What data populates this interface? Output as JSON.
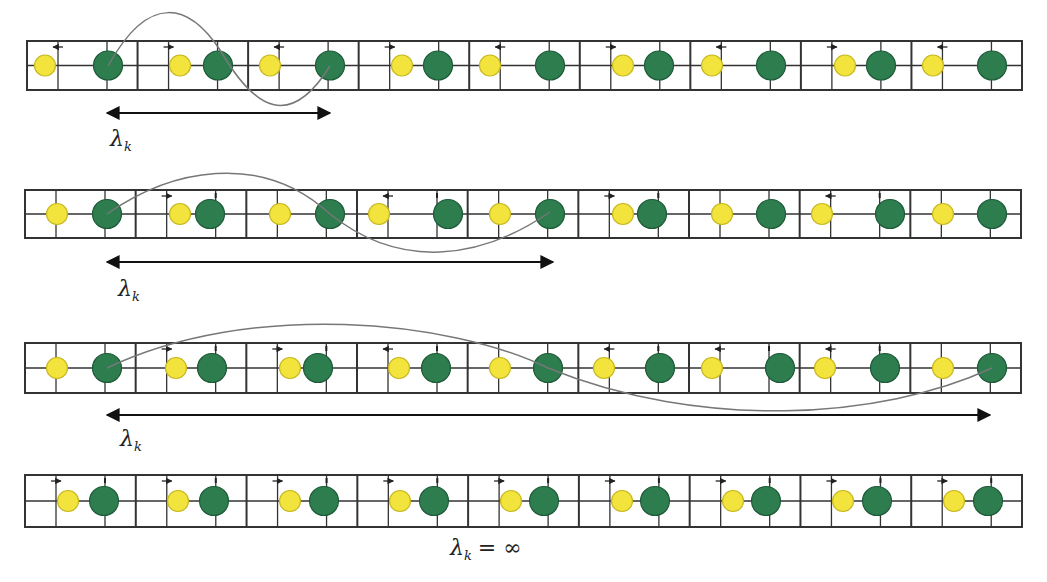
{
  "figure": {
    "title": "",
    "colors": {
      "grid_line": "#333333",
      "yellow_atom": "#f2e43c",
      "yellow_atom_stroke": "#c8b820",
      "green_atom": "#2e7d4f",
      "green_atom_stroke": "#1d5a37",
      "wave": "#777777",
      "arrow": "#111111"
    },
    "cell_count": 9,
    "rows": [
      {
        "id": "row-1",
        "box": {
          "x": 27,
          "y": 41,
          "w": 995,
          "h": 49
        },
        "yellow_x": [
          45,
          180,
          270,
          402,
          490,
          623,
          712,
          845,
          933
        ],
        "green_x": [
          108,
          218,
          330,
          438,
          550,
          659,
          771,
          881,
          992
        ],
        "displacement_arrows": [
          "left",
          "right",
          "left",
          "right",
          "left",
          "right",
          "left",
          "right",
          "left"
        ],
        "wave_path": "M108,66 C150,-10 190,5 220,50 C255,110 290,130 330,66",
        "wavelength_arrow": {
          "x1": 107,
          "x2": 330,
          "y": 113
        },
        "label": {
          "symbol": "λ",
          "subscript": "k",
          "x": 110,
          "y": 126
        }
      },
      {
        "id": "row-2",
        "box": {
          "x": 25,
          "y": 190,
          "w": 996,
          "h": 48
        },
        "yellow_x": [
          57,
          180,
          280,
          379,
          500,
          623,
          722,
          822,
          943
        ],
        "green_x": [
          107,
          210,
          330,
          448,
          550,
          652,
          771,
          890,
          992
        ],
        "displacement_arrows": [
          "none",
          "right",
          "none",
          "left",
          "none",
          "right",
          "none",
          "left",
          "none"
        ],
        "wave_path": "M107,214 C170,170 260,150 330,214 C400,270 480,260 550,212",
        "wavelength_arrow": {
          "x1": 107,
          "x2": 553,
          "y": 262
        },
        "label": {
          "symbol": "λ",
          "subscript": "k",
          "x": 118,
          "y": 276
        }
      },
      {
        "id": "row-3",
        "box": {
          "x": 25,
          "y": 343,
          "w": 996,
          "h": 50
        },
        "yellow_x": [
          57,
          176,
          290,
          399,
          500,
          604,
          712,
          825,
          943
        ],
        "green_x": [
          107,
          212,
          318,
          436,
          548,
          660,
          780,
          885,
          992
        ],
        "displacement_arrows": [
          "none",
          "right",
          "right",
          "left",
          "none",
          "left",
          "left",
          "left",
          "none"
        ],
        "wave_path": "M107,368 C250,300 450,320 548,368 C700,430 880,420 992,368",
        "wavelength_arrow": {
          "x1": 107,
          "x2": 990,
          "y": 415
        },
        "label": {
          "symbol": "λ",
          "subscript": "k",
          "x": 120,
          "y": 426
        }
      },
      {
        "id": "row-4",
        "box": {
          "x": 25,
          "y": 475,
          "w": 997,
          "h": 52
        },
        "yellow_x": [
          68,
          178,
          290,
          400,
          511,
          622,
          733,
          843,
          954
        ],
        "green_x": [
          104,
          214,
          324,
          434,
          544,
          655,
          766,
          877,
          988
        ],
        "displacement_arrows": [
          "right",
          "right",
          "right",
          "right",
          "right",
          "right",
          "right",
          "right",
          "right"
        ],
        "wave_path": "",
        "wavelength_arrow": null,
        "label": {
          "symbol": "λ",
          "subscript": "k",
          "equals": "= ∞",
          "x": 450,
          "y": 535
        }
      }
    ]
  }
}
